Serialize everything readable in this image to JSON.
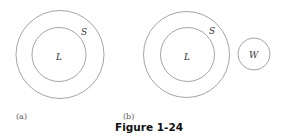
{
  "figure": {
    "caption": "Figure 1-24",
    "panels": [
      {
        "label": "(a)",
        "sets": [
          {
            "name": "S",
            "role": "outer"
          },
          {
            "name": "L",
            "role": "inner",
            "contained_in": "S"
          }
        ]
      },
      {
        "label": "(b)",
        "sets": [
          {
            "name": "S",
            "role": "outer"
          },
          {
            "name": "L",
            "role": "inner",
            "contained_in": "S"
          },
          {
            "name": "W",
            "role": "separate"
          }
        ]
      }
    ]
  },
  "colors": {
    "stroke": "#9a9a9a",
    "text": "#333333",
    "caption": "#111111"
  }
}
